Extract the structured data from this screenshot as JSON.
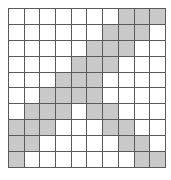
{
  "grid": {
    "rows": 10,
    "cols": 10,
    "fill_color": "#c9c9c9",
    "empty_color": "#ffffff",
    "line_color": "#5a5a5a",
    "cells": [
      [
        0,
        0,
        0,
        0,
        0,
        0,
        0,
        1,
        1,
        1
      ],
      [
        0,
        0,
        0,
        0,
        0,
        0,
        1,
        1,
        1,
        0
      ],
      [
        0,
        0,
        0,
        0,
        0,
        1,
        1,
        1,
        0,
        0
      ],
      [
        0,
        0,
        0,
        0,
        1,
        1,
        1,
        0,
        0,
        0
      ],
      [
        0,
        0,
        0,
        1,
        1,
        1,
        0,
        0,
        0,
        0
      ],
      [
        0,
        0,
        1,
        1,
        1,
        1,
        0,
        0,
        0,
        0
      ],
      [
        0,
        1,
        1,
        1,
        0,
        1,
        1,
        0,
        0,
        0
      ],
      [
        1,
        1,
        1,
        0,
        0,
        0,
        1,
        1,
        0,
        0
      ],
      [
        1,
        1,
        0,
        0,
        0,
        0,
        0,
        1,
        1,
        0
      ],
      [
        1,
        0,
        0,
        0,
        0,
        0,
        0,
        0,
        1,
        1
      ]
    ]
  }
}
